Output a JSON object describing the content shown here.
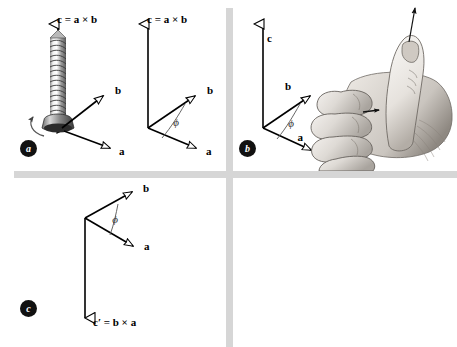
{
  "figure": {
    "background_color": "#ffffff",
    "divider_color": "#d6d6d6",
    "ink_color": "#000000"
  },
  "panels": [
    {
      "id": "a",
      "badge_label": "a",
      "caption_note": "screw rotated from a into b advances along c",
      "diagrams": [
        {
          "kind": "screw-diagram",
          "vectors": [
            {
              "name": "c",
              "label": "c = a × b",
              "direction": "up",
              "arrowhead": "hollow-triangle"
            },
            {
              "name": "b",
              "label": "b",
              "direction": "upper-right",
              "arrowhead": "hollow-triangle"
            },
            {
              "name": "a",
              "label": "a",
              "direction": "lower-right",
              "arrowhead": "hollow-triangle"
            }
          ],
          "rotation_arrow": "counterclockwise-curved-arrow",
          "object": "threaded-screw"
        },
        {
          "kind": "vector-triad",
          "vectors": [
            {
              "name": "c",
              "label": "c = a × b",
              "direction": "up",
              "arrowhead": "hollow-triangle"
            },
            {
              "name": "b",
              "label": "b",
              "direction": "upper-right",
              "arrowhead": "hollow-triangle"
            },
            {
              "name": "a",
              "label": "a",
              "direction": "lower-right",
              "arrowhead": "hollow-triangle"
            }
          ],
          "angle": {
            "symbol": "ϕ",
            "between": [
              "a",
              "b"
            ]
          }
        }
      ]
    },
    {
      "id": "b",
      "badge_label": "b",
      "caption_note": "right hand rule, fingers curl from a to b, thumb gives c",
      "diagrams": [
        {
          "kind": "vector-triad",
          "vectors": [
            {
              "name": "c",
              "label": "c",
              "direction": "up",
              "arrowhead": "hollow-triangle"
            },
            {
              "name": "b",
              "label": "b",
              "direction": "upper-right",
              "arrowhead": "hollow-triangle"
            },
            {
              "name": "a",
              "label": "a",
              "direction": "lower-right",
              "arrowhead": "hollow-triangle"
            }
          ],
          "angle": {
            "symbol": "ϕ",
            "between": [
              "a",
              "b"
            ]
          }
        },
        {
          "kind": "hand-illustration",
          "object": "right-hand-fist-thumb-up",
          "arrow": "thumb-direction-arrow"
        }
      ]
    },
    {
      "id": "c",
      "badge_label": "c",
      "caption_note": "reversing the order reverses the cross product",
      "diagrams": [
        {
          "kind": "vector-triad-reversed",
          "vectors": [
            {
              "name": "b",
              "label": "b",
              "direction": "upper-right",
              "arrowhead": "hollow-triangle"
            },
            {
              "name": "a",
              "label": "a",
              "direction": "lower-right",
              "arrowhead": "hollow-triangle"
            },
            {
              "name": "cprime",
              "label": "c′ = b × a",
              "direction": "down",
              "arrowhead": "hollow-triangle-down"
            }
          ],
          "angle": {
            "symbol": "ϕ",
            "between": [
              "b",
              "a"
            ]
          }
        }
      ]
    }
  ]
}
